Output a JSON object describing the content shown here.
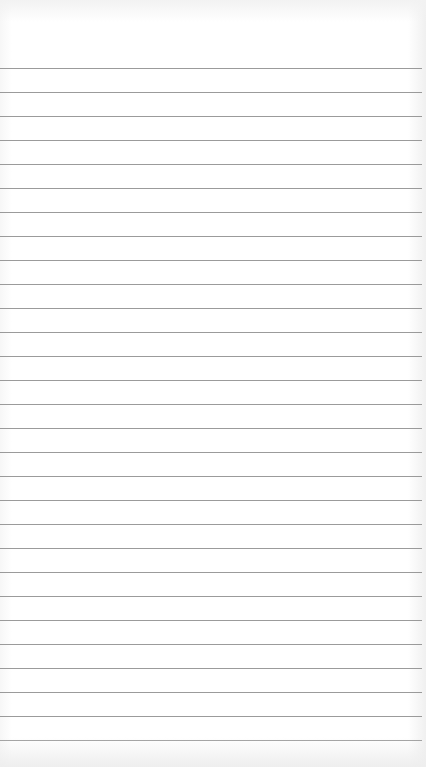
{
  "image": {
    "description": "Blank lined notepad paper",
    "background_color": "#ffffff",
    "line_color": "#8a8a8a",
    "line_count": 29,
    "first_line_y": 68,
    "line_spacing": 24
  }
}
